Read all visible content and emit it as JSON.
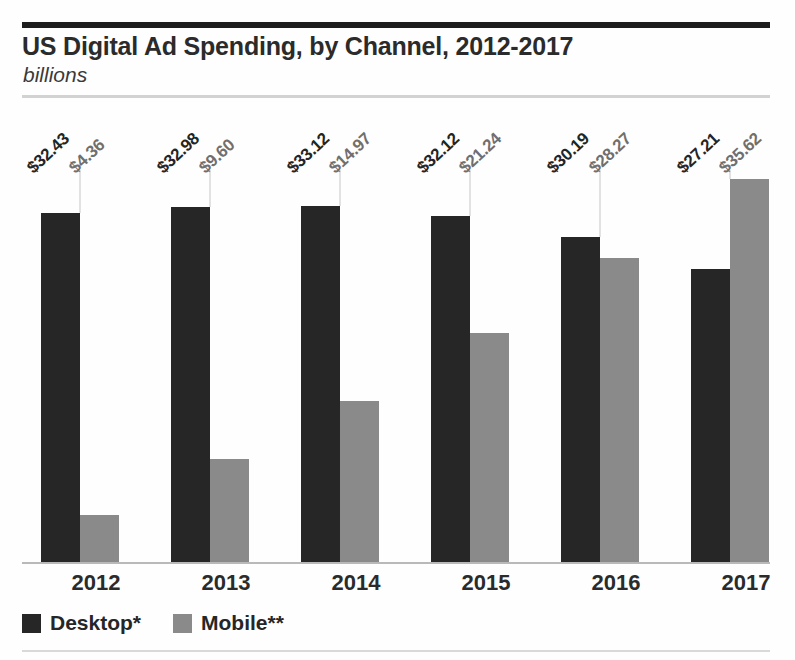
{
  "header": {
    "title": "US Digital Ad Spending, by Channel, 2012-2017",
    "subtitle": "billions"
  },
  "legend": {
    "items": [
      {
        "label": "Desktop*",
        "color": "#262626",
        "swatch": "desktop-swatch-icon"
      },
      {
        "label": "Mobile**",
        "color": "#8a8a8a",
        "swatch": "mobile-swatch-icon"
      }
    ]
  },
  "chart_data": {
    "type": "bar",
    "title": "US Digital Ad Spending, by Channel, 2012-2017",
    "subtitle": "billions",
    "xlabel": "",
    "ylabel": "billions",
    "ylim": [
      0,
      40
    ],
    "grid": false,
    "legend_position": "bottom-left",
    "categories": [
      "2012",
      "2013",
      "2014",
      "2015",
      "2016",
      "2017"
    ],
    "series": [
      {
        "name": "Desktop*",
        "color": "#262626",
        "values": [
          32.43,
          32.98,
          33.12,
          32.12,
          30.19,
          27.21
        ],
        "labels": [
          "$32.43",
          "$32.98",
          "$33.12",
          "$32.12",
          "$30.19",
          "$27.21"
        ]
      },
      {
        "name": "Mobile**",
        "color": "#8a8a8a",
        "values": [
          4.36,
          9.6,
          14.97,
          21.24,
          28.27,
          35.62
        ],
        "labels": [
          "$4.36",
          "$9.60",
          "$14.97",
          "$21.24",
          "$28.27",
          "$35.62"
        ]
      }
    ]
  }
}
